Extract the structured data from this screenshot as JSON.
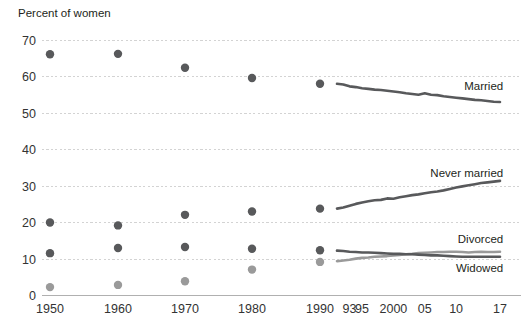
{
  "chart_data": {
    "type": "scatter",
    "title": "Percent of women",
    "xlabel": "",
    "ylabel": "Percent of women",
    "ylim": [
      0,
      72
    ],
    "yticks": [
      0,
      10,
      20,
      30,
      40,
      50,
      60,
      70
    ],
    "ytick_labels": [
      "0",
      "10",
      "20",
      "30",
      "40",
      "50",
      "60",
      "70"
    ],
    "xlim": [
      1946,
      2019
    ],
    "xticks": [
      1950,
      1960,
      1970,
      1980,
      1990,
      1993,
      1995,
      2000,
      2005,
      2010,
      2017
    ],
    "xtick_labels": [
      "1950",
      "1960",
      "1970",
      "1980",
      "1990",
      "93",
      "95",
      "2000",
      "05",
      "10",
      "17"
    ],
    "grid": true,
    "legend_position": "right-inline",
    "decade_points_x": [
      1950,
      1960,
      1970,
      1980,
      1990
    ],
    "series": [
      {
        "name": "Married",
        "label": "Married",
        "color": "#58595b",
        "label_x": 2014,
        "label_y": 57.5,
        "points": [
          66.1,
          66.2,
          62.4,
          59.6,
          58.0
        ],
        "line_x": [
          1991,
          1992,
          1993,
          1994,
          1995,
          1996,
          1997,
          1998,
          1999,
          2000,
          2001,
          2002,
          2003,
          2004,
          2005,
          2006,
          2007,
          2008,
          2009,
          2010,
          2011,
          2012,
          2013,
          2014,
          2015,
          2016,
          2017
        ],
        "line_y": [
          58.0,
          57.8,
          57.3,
          57.1,
          56.8,
          56.6,
          56.4,
          56.3,
          56.1,
          55.9,
          55.7,
          55.4,
          55.2,
          55.0,
          55.4,
          55.0,
          54.9,
          54.6,
          54.4,
          54.2,
          54.0,
          53.8,
          53.6,
          53.5,
          53.3,
          53.1,
          53.0
        ]
      },
      {
        "name": "Never married",
        "label": "Never married",
        "color": "#58595b",
        "label_x": 2014,
        "label_y": 33.5,
        "points": [
          20.0,
          19.2,
          22.1,
          23.0,
          23.8
        ],
        "line_x": [
          1991,
          1992,
          1993,
          1994,
          1995,
          1996,
          1997,
          1998,
          1999,
          2000,
          2001,
          2002,
          2003,
          2004,
          2005,
          2006,
          2007,
          2008,
          2009,
          2010,
          2011,
          2012,
          2013,
          2014,
          2015,
          2016,
          2017
        ],
        "line_y": [
          23.8,
          24.1,
          24.6,
          25.1,
          25.5,
          25.8,
          26.1,
          26.2,
          26.6,
          26.5,
          26.9,
          27.2,
          27.5,
          27.7,
          28.0,
          28.3,
          28.5,
          28.8,
          29.2,
          29.6,
          29.9,
          30.2,
          30.5,
          30.8,
          31.0,
          31.2,
          31.4
        ]
      },
      {
        "name": "Divorced",
        "label": "Divorced",
        "color": "#9a9a9a",
        "label_x": 2014,
        "label_y": 15.4,
        "points": [
          2.3,
          2.9,
          3.9,
          7.1,
          9.2
        ],
        "line_x": [
          1991,
          1992,
          1993,
          1994,
          1995,
          1996,
          1997,
          1998,
          1999,
          2000,
          2001,
          2002,
          2003,
          2004,
          2005,
          2006,
          2007,
          2008,
          2009,
          2010,
          2011,
          2012,
          2013,
          2014,
          2015,
          2016,
          2017
        ],
        "line_y": [
          9.4,
          9.6,
          9.8,
          10.1,
          10.3,
          10.4,
          10.6,
          10.7,
          10.8,
          11.0,
          11.1,
          11.3,
          11.4,
          11.6,
          11.7,
          11.8,
          11.9,
          11.9,
          12.0,
          12.0,
          11.9,
          11.8,
          11.9,
          12.0,
          11.9,
          11.9,
          12.0
        ]
      },
      {
        "name": "Widowed",
        "label": "Widowed",
        "color": "#58595b",
        "label_x": 2014,
        "label_y": 7.6,
        "points": [
          11.6,
          13.0,
          13.3,
          12.8,
          12.4
        ],
        "line_x": [
          1991,
          1992,
          1993,
          1994,
          1995,
          1996,
          1997,
          1998,
          1999,
          2000,
          2001,
          2002,
          2003,
          2004,
          2005,
          2006,
          2007,
          2008,
          2009,
          2010,
          2011,
          2012,
          2013,
          2014,
          2015,
          2016,
          2017
        ],
        "line_y": [
          12.3,
          12.2,
          12.0,
          11.9,
          11.8,
          11.8,
          11.7,
          11.6,
          11.5,
          11.4,
          11.4,
          11.3,
          11.3,
          11.2,
          11.1,
          11.0,
          11.0,
          10.9,
          10.8,
          10.7,
          10.6,
          10.6,
          10.6,
          10.6,
          10.6,
          10.6,
          10.6
        ]
      }
    ]
  }
}
